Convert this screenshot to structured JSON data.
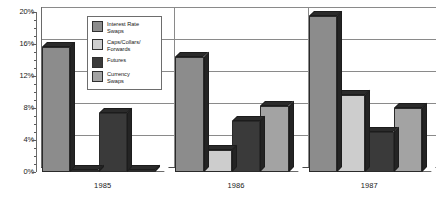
{
  "chart_data": {
    "type": "bar",
    "title": "",
    "subtitle": "",
    "xlabel": "",
    "ylabel": "",
    "categories": [
      "1985",
      "1986",
      "1987"
    ],
    "series": [
      {
        "name": "Interest Rate Swaps",
        "color": "#8c8c8c",
        "values": [
          15.6,
          14.4,
          19.5
        ]
      },
      {
        "name": "Caps/Collars/Forwards",
        "color": "#cdcdcd",
        "values": [
          0.3,
          2.8,
          9.6
        ]
      },
      {
        "name": "Futures",
        "color": "#3a3a3a",
        "values": [
          7.4,
          6.4,
          5.0
        ]
      },
      {
        "name": "Currency Swaps",
        "color": "#a3a3a3",
        "values": [
          0.3,
          8.3,
          8.0
        ]
      }
    ],
    "ylim": [
      0,
      20
    ],
    "yticks": [
      0,
      4,
      8,
      12,
      16,
      20
    ],
    "ytick_labels": [
      "0%",
      "4%",
      "8%",
      "12%",
      "16%",
      "20%"
    ],
    "minor_tick_step": 1,
    "grid": true,
    "grid_axis": "y",
    "legend_position": "upper-center",
    "style": "3d-column",
    "value_unit": "%"
  },
  "legend": {
    "items": [
      {
        "label_line1": "Interest Rate",
        "label_line2": "Swaps"
      },
      {
        "label_line1": "Caps/Collars/",
        "label_line2": "Forwards"
      },
      {
        "label_line1": "Futures",
        "label_line2": ""
      },
      {
        "label_line1": "Currency",
        "label_line2": "Swaps"
      }
    ]
  }
}
